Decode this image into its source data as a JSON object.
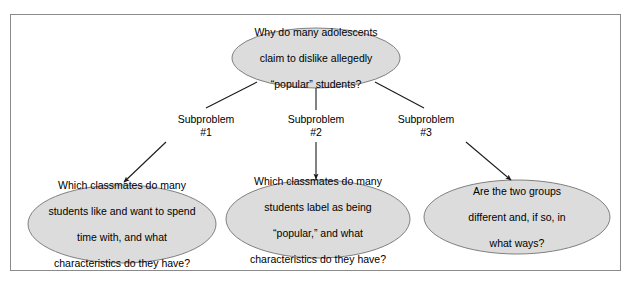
{
  "diagram": {
    "type": "problem-decomposition-tree",
    "frame": {
      "border_color": "#8a8a8a",
      "background": "#ffffff"
    },
    "style": {
      "ellipse_fill": "#dcdcdc",
      "ellipse_stroke": "#808080",
      "connector_color": "#1a1a1a",
      "text_color": "#000000"
    },
    "root": {
      "id": "root-question",
      "lines": [
        "Why do many adolescents",
        "claim to dislike allegedly",
        "“popular” students?"
      ]
    },
    "edges": [
      {
        "id": "edge-1",
        "label_line1": "Subproblem",
        "label_line2": "#1"
      },
      {
        "id": "edge-2",
        "label_line1": "Subproblem",
        "label_line2": "#2"
      },
      {
        "id": "edge-3",
        "label_line1": "Subproblem",
        "label_line2": "#3"
      }
    ],
    "subproblems": [
      {
        "id": "subproblem-1",
        "lines": [
          "Which classmates do many",
          "students like and want to spend",
          "time with, and what",
          "characteristics do they have?"
        ]
      },
      {
        "id": "subproblem-2",
        "lines": [
          "Which classmates do many",
          "students label as being",
          "“popular,” and what",
          "characteristics do they have?"
        ]
      },
      {
        "id": "subproblem-3",
        "lines": [
          "Are the two groups",
          "different and, if so, in",
          "what ways?"
        ]
      }
    ]
  }
}
